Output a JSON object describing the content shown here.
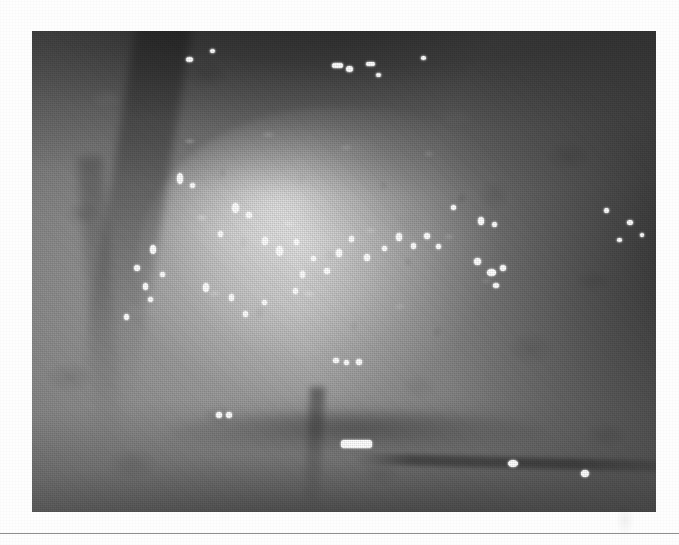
{
  "page": {
    "background_color": "#fefefe",
    "width": 679,
    "height": 545
  },
  "figure": {
    "kind": "clinical-photograph",
    "modality": "endoscopy",
    "color_mode": "grayscale",
    "caption": "",
    "label": "",
    "frame": {
      "x": 32,
      "y": 31,
      "width": 624,
      "height": 481
    },
    "border_color": "#4a4a4a",
    "tones": {
      "lesion_highlight": "#e8e8e8",
      "lesion_midtone": "#bdbdbd",
      "mucosa_midtone": "#8a8a8a",
      "shadow": "#3c3c3c",
      "deep_shadow": "#232323",
      "specular_white": "#ffffff"
    },
    "regions": [
      {
        "name": "upper-shadowed-fold",
        "tone": "deep_shadow"
      },
      {
        "name": "central-nodular-lesion",
        "tone": "lesion_highlight"
      },
      {
        "name": "left-mucosal-fold",
        "tone": "shadow"
      },
      {
        "name": "right-vignette",
        "tone": "shadow"
      },
      {
        "name": "lower-mucosa",
        "tone": "mucosa_midtone"
      }
    ],
    "specular_highlights": [
      {
        "x": 186,
        "y": 57,
        "w": 7,
        "h": 5,
        "shape": "dot"
      },
      {
        "x": 210,
        "y": 49,
        "w": 5,
        "h": 4,
        "shape": "dot"
      },
      {
        "x": 332,
        "y": 63,
        "w": 11,
        "h": 5,
        "shape": "bar"
      },
      {
        "x": 346,
        "y": 66,
        "w": 7,
        "h": 6,
        "shape": "dot"
      },
      {
        "x": 366,
        "y": 62,
        "w": 9,
        "h": 4,
        "shape": "bar"
      },
      {
        "x": 376,
        "y": 73,
        "w": 5,
        "h": 4,
        "shape": "dot"
      },
      {
        "x": 421,
        "y": 56,
        "w": 5,
        "h": 4,
        "shape": "dot"
      },
      {
        "x": 177,
        "y": 173,
        "w": 6,
        "h": 11,
        "shape": "dot"
      },
      {
        "x": 190,
        "y": 183,
        "w": 5,
        "h": 5,
        "shape": "dot"
      },
      {
        "x": 150,
        "y": 245,
        "w": 6,
        "h": 9,
        "shape": "dot"
      },
      {
        "x": 134,
        "y": 265,
        "w": 6,
        "h": 6,
        "shape": "dot"
      },
      {
        "x": 160,
        "y": 272,
        "w": 5,
        "h": 5,
        "shape": "dot"
      },
      {
        "x": 143,
        "y": 283,
        "w": 5,
        "h": 7,
        "shape": "dot"
      },
      {
        "x": 148,
        "y": 297,
        "w": 5,
        "h": 5,
        "shape": "dot"
      },
      {
        "x": 124,
        "y": 314,
        "w": 5,
        "h": 6,
        "shape": "dot"
      },
      {
        "x": 232,
        "y": 203,
        "w": 7,
        "h": 10,
        "shape": "dot"
      },
      {
        "x": 246,
        "y": 212,
        "w": 6,
        "h": 6,
        "shape": "dot"
      },
      {
        "x": 218,
        "y": 231,
        "w": 5,
        "h": 6,
        "shape": "dot"
      },
      {
        "x": 262,
        "y": 237,
        "w": 6,
        "h": 8,
        "shape": "dot"
      },
      {
        "x": 276,
        "y": 246,
        "w": 7,
        "h": 10,
        "shape": "dot"
      },
      {
        "x": 294,
        "y": 239,
        "w": 5,
        "h": 6,
        "shape": "dot"
      },
      {
        "x": 311,
        "y": 256,
        "w": 5,
        "h": 5,
        "shape": "dot"
      },
      {
        "x": 300,
        "y": 271,
        "w": 5,
        "h": 7,
        "shape": "dot"
      },
      {
        "x": 324,
        "y": 268,
        "w": 6,
        "h": 6,
        "shape": "dot"
      },
      {
        "x": 336,
        "y": 249,
        "w": 6,
        "h": 8,
        "shape": "dot"
      },
      {
        "x": 349,
        "y": 236,
        "w": 5,
        "h": 6,
        "shape": "dot"
      },
      {
        "x": 364,
        "y": 254,
        "w": 6,
        "h": 7,
        "shape": "dot"
      },
      {
        "x": 382,
        "y": 246,
        "w": 5,
        "h": 5,
        "shape": "dot"
      },
      {
        "x": 396,
        "y": 233,
        "w": 6,
        "h": 8,
        "shape": "dot"
      },
      {
        "x": 411,
        "y": 243,
        "w": 5,
        "h": 6,
        "shape": "dot"
      },
      {
        "x": 424,
        "y": 233,
        "w": 6,
        "h": 6,
        "shape": "dot"
      },
      {
        "x": 436,
        "y": 244,
        "w": 5,
        "h": 5,
        "shape": "dot"
      },
      {
        "x": 203,
        "y": 283,
        "w": 6,
        "h": 9,
        "shape": "dot"
      },
      {
        "x": 229,
        "y": 294,
        "w": 5,
        "h": 7,
        "shape": "dot"
      },
      {
        "x": 243,
        "y": 311,
        "w": 5,
        "h": 6,
        "shape": "dot"
      },
      {
        "x": 262,
        "y": 300,
        "w": 5,
        "h": 5,
        "shape": "dot"
      },
      {
        "x": 293,
        "y": 288,
        "w": 5,
        "h": 6,
        "shape": "dot"
      },
      {
        "x": 333,
        "y": 358,
        "w": 6,
        "h": 5,
        "shape": "bar"
      },
      {
        "x": 344,
        "y": 360,
        "w": 5,
        "h": 5,
        "shape": "dot"
      },
      {
        "x": 356,
        "y": 359,
        "w": 6,
        "h": 6,
        "shape": "dot"
      },
      {
        "x": 451,
        "y": 205,
        "w": 5,
        "h": 5,
        "shape": "dot"
      },
      {
        "x": 478,
        "y": 217,
        "w": 6,
        "h": 8,
        "shape": "dot"
      },
      {
        "x": 492,
        "y": 222,
        "w": 5,
        "h": 5,
        "shape": "dot"
      },
      {
        "x": 474,
        "y": 258,
        "w": 7,
        "h": 7,
        "shape": "dot"
      },
      {
        "x": 487,
        "y": 269,
        "w": 9,
        "h": 7,
        "shape": "dot"
      },
      {
        "x": 500,
        "y": 265,
        "w": 6,
        "h": 6,
        "shape": "dot"
      },
      {
        "x": 493,
        "y": 283,
        "w": 6,
        "h": 5,
        "shape": "dot"
      },
      {
        "x": 604,
        "y": 208,
        "w": 5,
        "h": 5,
        "shape": "dot"
      },
      {
        "x": 627,
        "y": 220,
        "w": 6,
        "h": 5,
        "shape": "dot"
      },
      {
        "x": 617,
        "y": 238,
        "w": 5,
        "h": 4,
        "shape": "dot"
      },
      {
        "x": 640,
        "y": 233,
        "w": 4,
        "h": 4,
        "shape": "dot"
      },
      {
        "x": 216,
        "y": 412,
        "w": 6,
        "h": 6,
        "shape": "bar"
      },
      {
        "x": 226,
        "y": 412,
        "w": 6,
        "h": 6,
        "shape": "bar"
      },
      {
        "x": 341,
        "y": 440,
        "w": 31,
        "h": 8,
        "shape": "bar"
      },
      {
        "x": 508,
        "y": 460,
        "w": 10,
        "h": 7,
        "shape": "dot"
      },
      {
        "x": 581,
        "y": 470,
        "w": 8,
        "h": 7,
        "shape": "dot"
      }
    ]
  },
  "rule": {
    "name": "page-divider",
    "y": 533,
    "color": "#8e8e8e"
  }
}
